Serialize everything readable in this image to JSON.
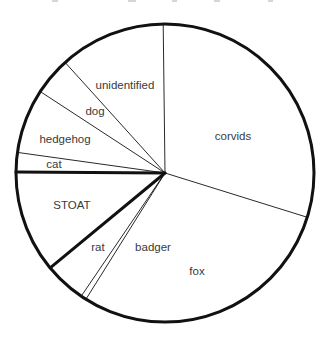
{
  "chart_data": {
    "type": "pie",
    "title": "",
    "start_angle_deg": -17.3,
    "direction": "counterclockwise",
    "slices": [
      {
        "label": "corvids",
        "value": 30.0,
        "emphasis": false
      },
      {
        "label": "unidentified",
        "value": 11.5,
        "emphasis": false
      },
      {
        "label": "dog",
        "value": 4.1,
        "emphasis": false
      },
      {
        "label": "hedgehog",
        "value": 7.0,
        "emphasis": false
      },
      {
        "label": "cat",
        "value": 2.1,
        "emphasis": false
      },
      {
        "label": "STOAT",
        "value": 11.1,
        "emphasis": true
      },
      {
        "label": "rat",
        "value": 4.5,
        "emphasis": false
      },
      {
        "label": "badger",
        "value": 0.6,
        "emphasis": false
      },
      {
        "label": "fox",
        "value": 29.1,
        "emphasis": false
      }
    ],
    "categories": [
      "corvids",
      "unidentified",
      "dog",
      "hedgehog",
      "cat",
      "STOAT",
      "rat",
      "badger",
      "fox"
    ],
    "values": [
      30.0,
      11.5,
      4.1,
      7.0,
      2.1,
      11.1,
      4.5,
      0.6,
      29.1
    ],
    "unit": "percent (estimated from slice angles)",
    "legend": "none (labels placed inside slices)",
    "fill_color": "#ffffff",
    "stroke_color": "#111111"
  },
  "labels": {
    "corvids": {
      "text": "corvids",
      "x": 233,
      "y": 140
    },
    "unidentified": {
      "text": "unidentified",
      "x": 125,
      "y": 89
    },
    "dog": {
      "text": "dog",
      "x": 95,
      "y": 115
    },
    "hedgehog": {
      "text": "hedgehog",
      "x": 65,
      "y": 143
    },
    "cat": {
      "text": "cat",
      "x": 54,
      "y": 168
    },
    "STOAT": {
      "text": "STOAT",
      "x": 72,
      "y": 209
    },
    "rat": {
      "text": "rat",
      "x": 98,
      "y": 251
    },
    "badger": {
      "text": "badger",
      "x": 153,
      "y": 251
    },
    "fox": {
      "text": "fox",
      "x": 197,
      "y": 275
    }
  },
  "geometry": {
    "cx": 165,
    "cy": 173,
    "r": 149
  }
}
